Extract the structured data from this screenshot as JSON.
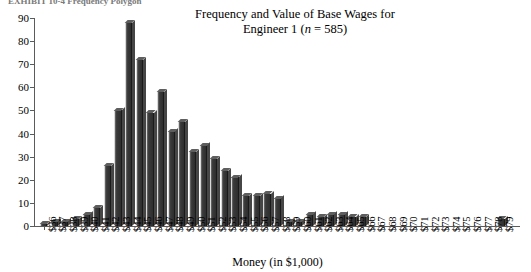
{
  "caption": {
    "partial_top_text": "EXHIBIT 10-4   Frequency Polygon"
  },
  "chart_data": {
    "type": "bar",
    "title": "Frequency and Value of Base Wages for",
    "title_line2_prefix": "Engineer 1 (",
    "title_line2_italic": "n",
    "title_line2_suffix": " = 585)",
    "title_full": "Frequency and Value of Base Wages for Engineer 1 (n = 585)",
    "xlabel": "Money (in $1,000)",
    "ylabel": "",
    "ylim": [
      0,
      90
    ],
    "yticks": [
      0,
      10,
      20,
      30,
      40,
      50,
      60,
      70,
      80,
      90
    ],
    "grid": false,
    "legend": "none",
    "sample_size": 585,
    "categories": [
      "$36",
      "$37",
      "$38",
      "$39",
      "$40",
      "$41",
      "$42",
      "$43",
      "$44",
      "$45",
      "$46",
      "$47",
      "$48",
      "$49",
      "$50",
      "$51",
      "$52",
      "$53",
      "$54",
      "$55",
      "$56",
      "$57",
      "$58",
      "$59",
      "$60",
      "$61",
      "$62",
      "$63",
      "$64",
      "$65",
      "$66",
      "$67",
      "$68",
      "$69",
      "$70",
      "$71",
      "$72",
      "$73",
      "$74",
      "$75",
      "$76",
      "$77",
      "$78",
      "$79"
    ],
    "values": [
      1,
      2,
      2,
      3,
      5,
      8,
      26,
      50,
      88,
      72,
      49,
      58,
      41,
      45,
      32,
      35,
      29,
      24,
      21,
      13,
      13,
      14,
      12,
      2,
      2,
      5,
      4,
      5,
      5,
      4,
      4,
      0,
      0,
      0,
      0,
      0,
      0,
      0,
      0,
      0,
      0,
      0,
      0,
      3
    ]
  }
}
